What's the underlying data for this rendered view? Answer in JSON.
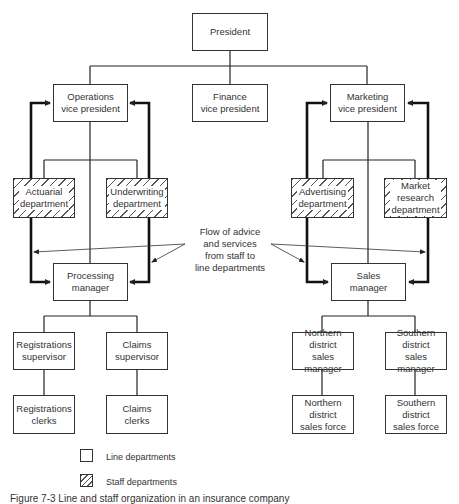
{
  "diagram": {
    "type": "organization-chart",
    "nodes": {
      "president": {
        "label": "President",
        "kind": "line"
      },
      "operations_vp": {
        "label": "Operations\nvice president",
        "kind": "line"
      },
      "finance_vp": {
        "label": "Finance\nvice president",
        "kind": "line"
      },
      "marketing_vp": {
        "label": "Marketing\nvice president",
        "kind": "line"
      },
      "actuarial": {
        "label": "Actuarial\ndepartment",
        "kind": "staff"
      },
      "underwriting": {
        "label": "Underwriting\ndepartment",
        "kind": "staff"
      },
      "advertising": {
        "label": "Advertising\ndepartment",
        "kind": "staff"
      },
      "market_research": {
        "label": "Market\nresearch\ndepartment",
        "kind": "staff"
      },
      "processing_manager": {
        "label": "Processing\nmanager",
        "kind": "line"
      },
      "sales_manager": {
        "label": "Sales\nmanager",
        "kind": "line"
      },
      "registrations_supervisor": {
        "label": "Registrations\nsupervisor",
        "kind": "line"
      },
      "claims_supervisor": {
        "label": "Claims\nsupervisor",
        "kind": "line"
      },
      "registrations_clerks": {
        "label": "Registrations\nclerks",
        "kind": "line"
      },
      "claims_clerks": {
        "label": "Claims\nclerks",
        "kind": "line"
      },
      "northern_manager": {
        "label": "Northern\ndistrict\nsales manager",
        "kind": "line"
      },
      "southern_manager": {
        "label": "Southern\ndistrict\nsales manager",
        "kind": "line"
      },
      "northern_force": {
        "label": "Northern\ndistrict\nsales force",
        "kind": "line"
      },
      "southern_force": {
        "label": "Southern\ndistrict\nsales force",
        "kind": "line"
      }
    },
    "edges": [
      [
        "president",
        "operations_vp"
      ],
      [
        "president",
        "finance_vp"
      ],
      [
        "president",
        "marketing_vp"
      ],
      [
        "operations_vp",
        "actuarial"
      ],
      [
        "operations_vp",
        "underwriting"
      ],
      [
        "operations_vp",
        "processing_manager"
      ],
      [
        "marketing_vp",
        "advertising"
      ],
      [
        "marketing_vp",
        "market_research"
      ],
      [
        "marketing_vp",
        "sales_manager"
      ],
      [
        "processing_manager",
        "registrations_supervisor"
      ],
      [
        "processing_manager",
        "claims_supervisor"
      ],
      [
        "registrations_supervisor",
        "registrations_clerks"
      ],
      [
        "claims_supervisor",
        "claims_clerks"
      ],
      [
        "sales_manager",
        "northern_manager"
      ],
      [
        "sales_manager",
        "southern_manager"
      ],
      [
        "northern_manager",
        "northern_force"
      ],
      [
        "southern_manager",
        "southern_force"
      ]
    ],
    "advice_flows": [
      [
        "actuarial",
        "operations_vp"
      ],
      [
        "underwriting",
        "operations_vp"
      ],
      [
        "actuarial",
        "processing_manager"
      ],
      [
        "underwriting",
        "processing_manager"
      ],
      [
        "advertising",
        "marketing_vp"
      ],
      [
        "market_research",
        "marketing_vp"
      ],
      [
        "advertising",
        "sales_manager"
      ],
      [
        "market_research",
        "sales_manager"
      ]
    ],
    "annotation": "Flow of advice\nand services\nfrom staff to\nline departments",
    "legend": {
      "line": "Line departments",
      "staff": "Staff departments"
    },
    "caption": "Figure 7-3  Line and staff organization in an insurance company"
  }
}
